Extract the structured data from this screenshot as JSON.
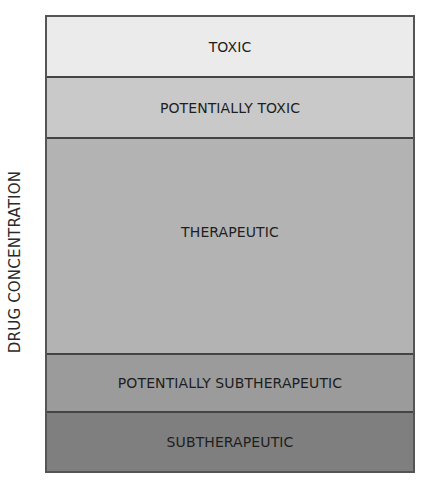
{
  "chart_data": {
    "type": "table",
    "title": "",
    "ylabel": "DRUG CONCENTRATION",
    "xlabel": "",
    "orientation": "vertical stacked bands (top = highest concentration)",
    "bands": [
      {
        "label": "TOXIC",
        "color": "#ebebeb",
        "height_px": 59
      },
      {
        "label": "POTENTIALLY TOXIC",
        "color": "#c9c9c9",
        "height_px": 61
      },
      {
        "label": "THERAPEUTIC",
        "color": "#b3b3b3",
        "height_px": 216
      },
      {
        "label": "POTENTIALLY SUBTHERAPEUTIC",
        "color": "#9b9b9b",
        "height_px": 58
      },
      {
        "label": "SUBTHERAPEUTIC",
        "color": "#7f7f7f",
        "height_px": 60
      }
    ],
    "grid": false,
    "legend": "none"
  },
  "axis": {
    "y_label": "DRUG CONCENTRATION"
  },
  "bands": [
    {
      "label": "TOXIC",
      "color": "#ebebeb",
      "height": "59px",
      "label_offset": "0px"
    },
    {
      "label": "POTENTIALLY TOXIC",
      "color": "#c9c9c9",
      "height": "61px",
      "label_offset": "0px"
    },
    {
      "label": "THERAPEUTIC",
      "color": "#b3b3b3",
      "height": "216px",
      "label_offset": "-14px"
    },
    {
      "label": "POTENTIALLY SUBTHERAPEUTIC",
      "color": "#9b9b9b",
      "height": "58px",
      "label_offset": "0px"
    },
    {
      "label": "SUBTHERAPEUTIC",
      "color": "#7f7f7f",
      "height": "60px",
      "label_offset": "0px"
    }
  ]
}
